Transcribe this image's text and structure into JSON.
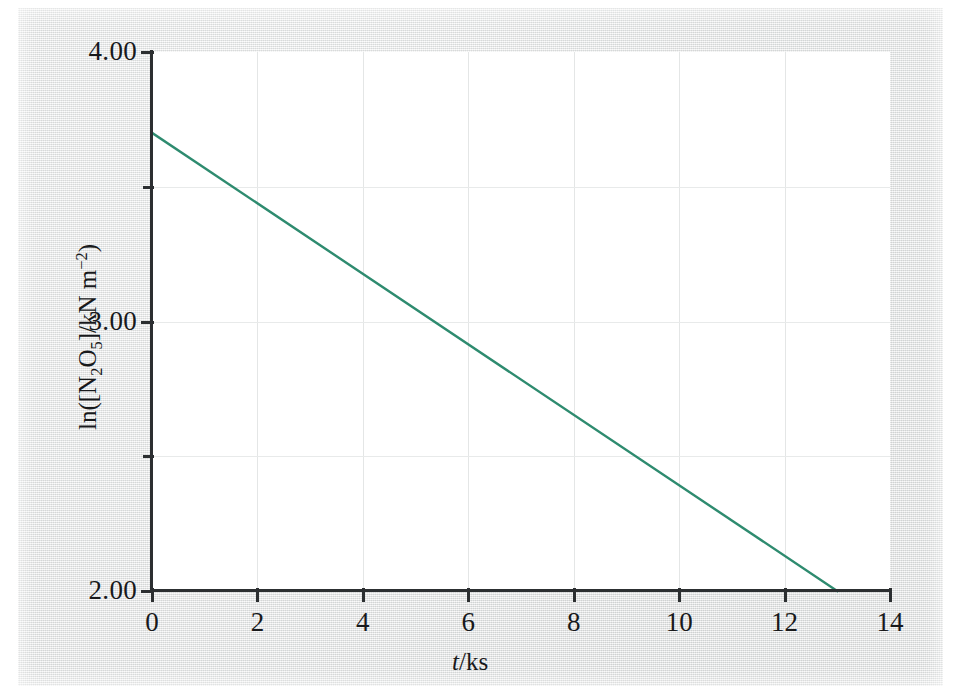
{
  "figure": {
    "background_color": "#e9eaea",
    "plot_background_color": "#ffffff",
    "axis_color": "#2c2f31",
    "grid_color": "#e6e8e8"
  },
  "chart_data": {
    "type": "line",
    "title": "",
    "subtitle": "",
    "xlabel": "t/ks",
    "ylabel": "ln([N2O5]/kN m^-2)",
    "ylabel_parts": {
      "prefix": "ln([N",
      "sub1": "2",
      "element2": "O",
      "sub2": "5",
      "middle": "]/kN m",
      "sup": "−2",
      "suffix": ")"
    },
    "xlabel_parts": {
      "italic": "t",
      "rest": "/ks"
    },
    "xlim": [
      0,
      14
    ],
    "ylim": [
      2.0,
      4.0
    ],
    "x_ticks": [
      0,
      2,
      4,
      6,
      8,
      10,
      12,
      14
    ],
    "x_tick_labels": [
      "0",
      "2",
      "4",
      "6",
      "8",
      "10",
      "12",
      "14"
    ],
    "y_ticks_major": [
      2.0,
      3.0,
      4.0
    ],
    "y_tick_labels": [
      "2.00",
      "3.00",
      "4.00"
    ],
    "y_ticks_minor": [
      2.5,
      3.5
    ],
    "grid": true,
    "grid_x_values": [
      2,
      4,
      6,
      8,
      10,
      12
    ],
    "grid_y_values": [
      2.5,
      3.0,
      3.5
    ],
    "legend": null,
    "series": [
      {
        "name": "ln([N2O5]) vs t",
        "color": "#2e8b6f",
        "line_width": 2.4,
        "x": [
          0.0,
          13.0
        ],
        "y": [
          3.7,
          2.0
        ],
        "slope": -0.1308,
        "intercept": 3.7
      }
    ]
  }
}
